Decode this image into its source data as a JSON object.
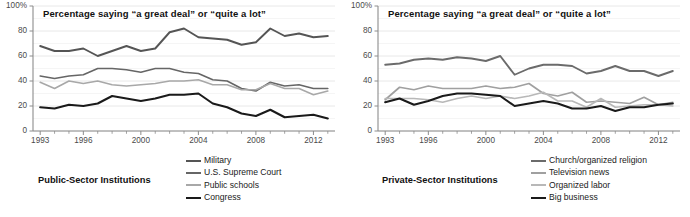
{
  "figure": {
    "background": "#ffffff",
    "axis_color": "#8c8c8c",
    "grid_color": "#e2e2e2"
  },
  "panels": [
    {
      "id": "public-sector",
      "caption": "Public-Sector Institutions",
      "title": "Percentage saying “a great deal” or “quite a lot”",
      "chart_data": {
        "type": "line",
        "title": "Percentage saying “a great deal” or “quite a lot”",
        "xlabel": "",
        "ylabel": "",
        "xlim": [
          1992.5,
          2013.5
        ],
        "ylim": [
          0,
          100
        ],
        "ytick_labels": [
          "0",
          "20",
          "40",
          "60",
          "80",
          "100%"
        ],
        "ytick_values": [
          0,
          20,
          40,
          60,
          80,
          100
        ],
        "xtick_labels": [
          "1993",
          "1996",
          "2000",
          "2004",
          "2008",
          "2012"
        ],
        "xtick_values": [
          1993,
          1996,
          2000,
          2004,
          2008,
          2012
        ],
        "grid": true,
        "legend_position": "bottom-right",
        "x": [
          1993,
          1994,
          1995,
          1996,
          1997,
          1998,
          1999,
          2000,
          2001,
          2002,
          2003,
          2004,
          2005,
          2006,
          2007,
          2008,
          2009,
          2010,
          2011,
          2012,
          2013
        ],
        "series": [
          {
            "name": "Military",
            "color": "#555555",
            "width": 1.9,
            "values": [
              68,
              64,
              64,
              66,
              60,
              64,
              68,
              64,
              66,
              79,
              82,
              75,
              74,
              73,
              69,
              71,
              82,
              76,
              78,
              75,
              76
            ]
          },
          {
            "name": "U.S. Supreme Court",
            "color": "#666666",
            "width": 1.6,
            "values": [
              44,
              42,
              44,
              45,
              50,
              50,
              49,
              47,
              50,
              50,
              47,
              46,
              41,
              40,
              34,
              32,
              39,
              36,
              37,
              34,
              34
            ]
          },
          {
            "name": "Public schools",
            "color": "#a8a8a8",
            "width": 1.6,
            "values": [
              39,
              34,
              40,
              38,
              40,
              37,
              36,
              37,
              38,
              40,
              40,
              41,
              37,
              37,
              33,
              33,
              38,
              34,
              34,
              29,
              32
            ]
          },
          {
            "name": "Congress",
            "color": "#1a1a1a",
            "width": 2.1,
            "values": [
              19,
              18,
              21,
              20,
              22,
              28,
              26,
              24,
              26,
              29,
              29,
              30,
              22,
              19,
              14,
              12,
              17,
              11,
              12,
              13,
              10
            ]
          }
        ]
      },
      "legend": [
        {
          "label": "Military",
          "color": "#555555",
          "width": 2.4
        },
        {
          "label": "U.S. Supreme Court",
          "color": "#666666",
          "width": 2.1
        },
        {
          "label": "Public schools",
          "color": "#a8a8a8",
          "width": 2.1
        },
        {
          "label": "Congress",
          "color": "#1a1a1a",
          "width": 2.6
        }
      ]
    },
    {
      "id": "private-sector",
      "caption": "Private-Sector Institutions",
      "title": "Percentage saying “a great deal” or “quite a lot”",
      "chart_data": {
        "type": "line",
        "title": "Percentage saying “a great deal” or “quite a lot”",
        "xlabel": "",
        "ylabel": "",
        "xlim": [
          1992.5,
          2013.5
        ],
        "ylim": [
          0,
          100
        ],
        "ytick_labels": [
          "0",
          "20",
          "40",
          "60",
          "80",
          "100%"
        ],
        "ytick_values": [
          0,
          20,
          40,
          60,
          80,
          100
        ],
        "xtick_labels": [
          "1993",
          "1996",
          "2000",
          "2004",
          "2008",
          "2012"
        ],
        "xtick_values": [
          1993,
          1996,
          2000,
          2004,
          2008,
          2012
        ],
        "grid": true,
        "legend_position": "bottom-right",
        "x": [
          1993,
          1994,
          1995,
          1996,
          1997,
          1998,
          1999,
          2000,
          2001,
          2002,
          2003,
          2004,
          2005,
          2006,
          2007,
          2008,
          2009,
          2010,
          2011,
          2012,
          2013
        ],
        "series": [
          {
            "name": "Church/organized religion",
            "color": "#6b6b6b",
            "width": 1.9,
            "values": [
              53,
              54,
              57,
              58,
              57,
              59,
              58,
              56,
              60,
              45,
              50,
              53,
              53,
              52,
              46,
              48,
              52,
              48,
              48,
              44,
              48
            ]
          },
          {
            "name": "Television news",
            "color": "#a0a0a0",
            "width": 1.7,
            "values": [
              25,
              35,
              33,
              36,
              34,
              34,
              34,
              36,
              34,
              35,
              38,
              30,
              28,
              31,
              23,
              24,
              23,
              22,
              27,
              21,
              23
            ]
          },
          {
            "name": "Organized labor",
            "color": "#b8b8b8",
            "width": 1.7,
            "values": [
              26,
              26,
              26,
              25,
              23,
              26,
              28,
              26,
              28,
              26,
              28,
              31,
              24,
              24,
              19,
              26,
              19,
              20,
              21,
              21,
              20
            ]
          },
          {
            "name": "Big business",
            "color": "#1a1a1a",
            "width": 2.1,
            "values": [
              23,
              26,
              21,
              24,
              28,
              30,
              30,
              29,
              28,
              20,
              22,
              24,
              22,
              18,
              18,
              20,
              16,
              19,
              19,
              21,
              22
            ]
          }
        ]
      },
      "legend": [
        {
          "label": "Church/organized religion",
          "color": "#6b6b6b",
          "width": 2.3
        },
        {
          "label": "Television news",
          "color": "#a0a0a0",
          "width": 2.1
        },
        {
          "label": "Organized labor",
          "color": "#b8b8b8",
          "width": 2.1
        },
        {
          "label": "Big business",
          "color": "#1a1a1a",
          "width": 2.6
        }
      ]
    }
  ]
}
